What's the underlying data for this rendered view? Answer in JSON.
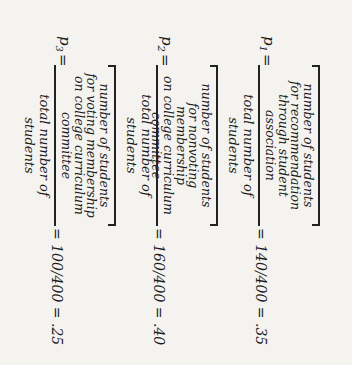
{
  "equations": [
    {
      "label": "p",
      "subscript": "1",
      "equals": "=",
      "numerator_lines": [
        "number of students",
        "for recommendation",
        "through student",
        "association"
      ],
      "denominator": "total number of students",
      "result": "= 140/400 = .35"
    },
    {
      "label": "p",
      "subscript": "2",
      "equals": "=",
      "numerator_lines": [
        "number of students",
        "for nonvoting membership",
        "on college curriculum",
        "committee"
      ],
      "denominator": "total number of students",
      "result": "= 160/400 = .40"
    },
    {
      "label": "p",
      "subscript": "3",
      "equals": "=",
      "numerator_lines": [
        "number of students",
        "for voting membership",
        "on college curriculum",
        "committee"
      ],
      "denominator": "total number of students",
      "result": "= 100/400 = .25"
    }
  ]
}
